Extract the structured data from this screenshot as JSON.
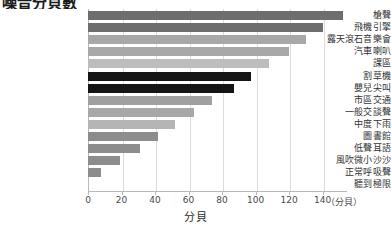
{
  "chart_data": {
    "type": "bar",
    "orientation": "horizontal",
    "title": "噪音分貝數",
    "title_cropped": true,
    "xlabel": "分貝",
    "ylabel": "",
    "unit_note": "（分貝）",
    "xlim": [
      0,
      140
    ],
    "xticks": [
      0,
      20,
      40,
      60,
      80,
      100,
      120,
      140
    ],
    "grid": true,
    "grid_axis": "x",
    "legend": "none",
    "categories": [
      "槍聲",
      "飛機引擎",
      "露天滾石音樂會",
      "汽車喇叭",
      "課區",
      "割草機",
      "嬰兒尖叫",
      "市區交通",
      "一般交談聲",
      "中度下雨",
      "圖書館",
      "低聲耳語",
      "風吹微小沙沙",
      "正常呼吸聲",
      "聽到極限"
    ],
    "values": [
      152,
      140,
      130,
      120,
      108,
      97,
      87,
      74,
      63,
      52,
      42,
      31,
      19,
      8,
      0
    ],
    "bar_colors": [
      "#6e6e6e",
      "#6e6e6e",
      "#a8a8a8",
      "#a8a8a8",
      "#bdbdbd",
      "#151515",
      "#151515",
      "#a0a0a0",
      "#a8a8a8",
      "#b5b5b5",
      "#8d8d8d",
      "#8d8d8d",
      "#8d8d8d",
      "#8d8d8d",
      "#8d8d8d"
    ]
  },
  "axis": {
    "tick_labels": [
      "0",
      "20",
      "40",
      "60",
      "80",
      "100",
      "120",
      "140"
    ],
    "unit": "（分貝）",
    "title": "分貝"
  }
}
